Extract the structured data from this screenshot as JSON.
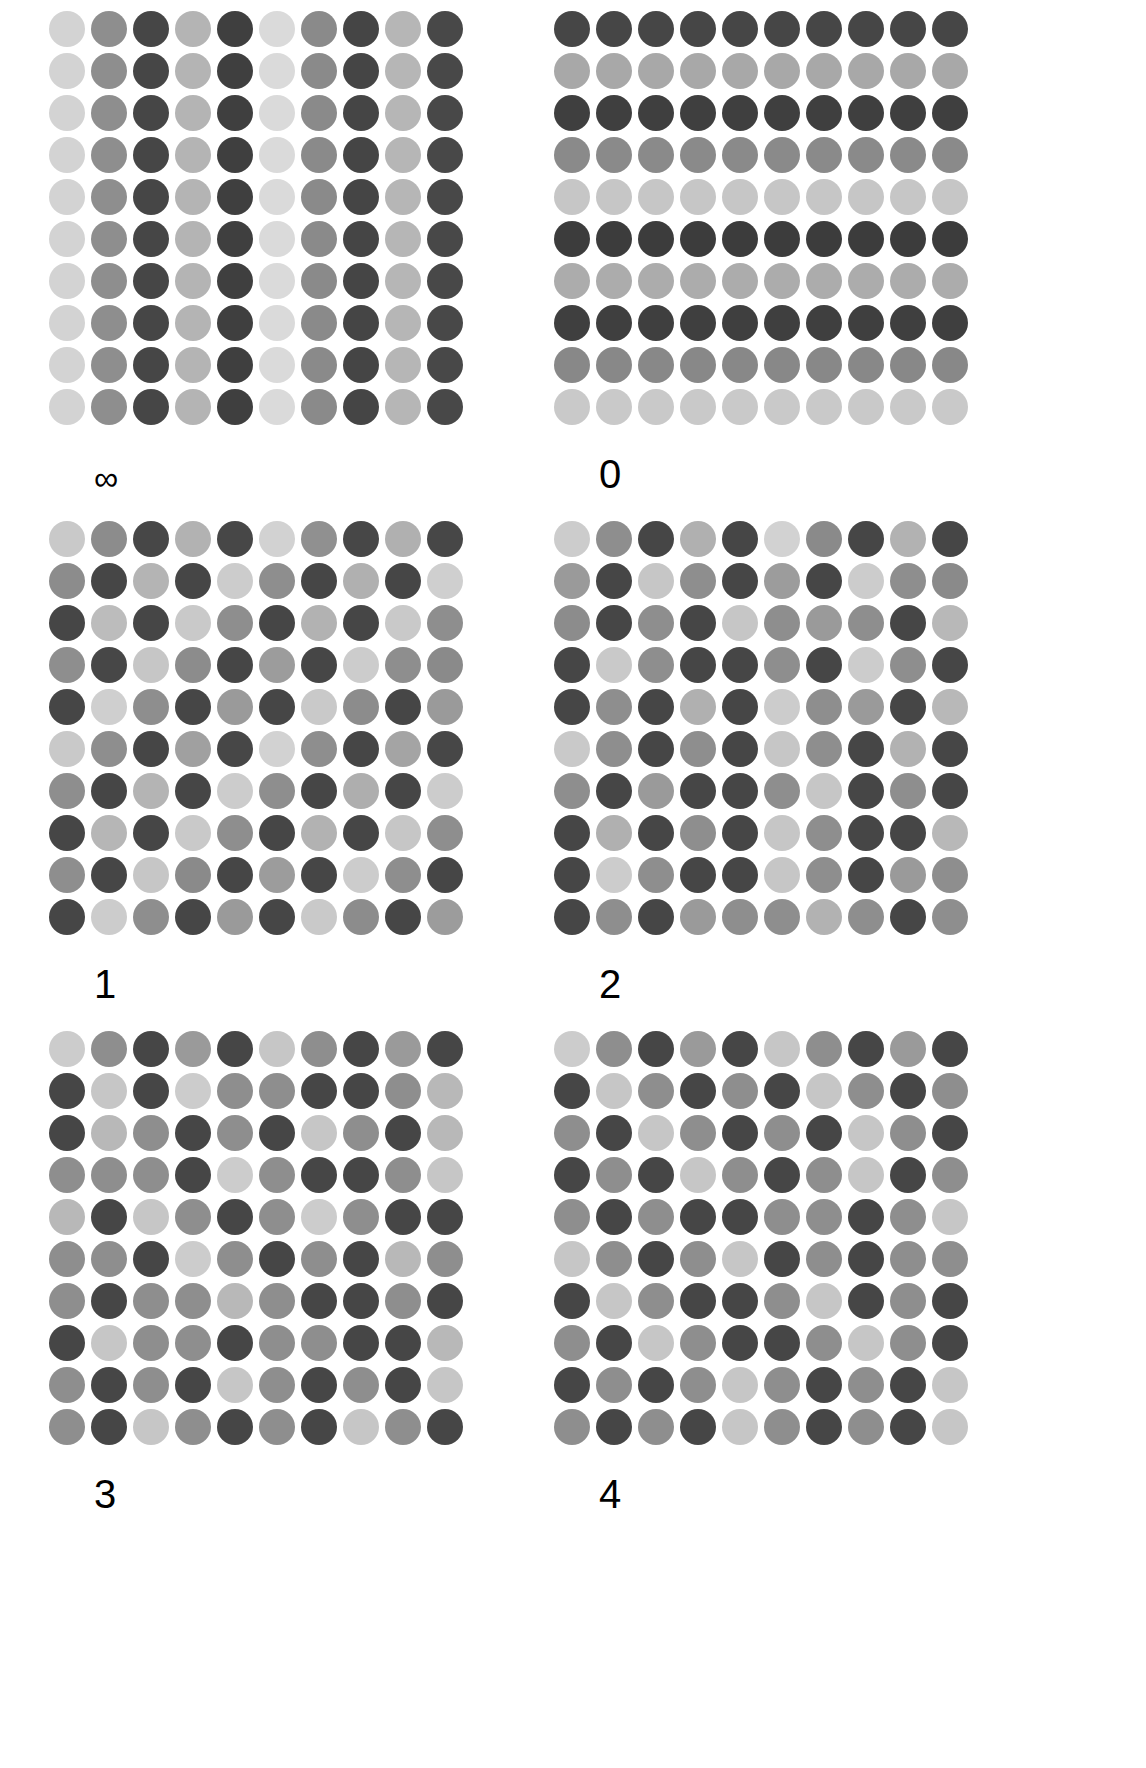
{
  "figure": {
    "background_color": "#ffffff",
    "columns": 2,
    "rows": 3,
    "grid_size": {
      "rows": 10,
      "cols": 10
    },
    "palette": {
      "level_0_lightest": "#d3d3d3",
      "level_1_light": "#c0c0c0",
      "level_2_mid": "#9a9a9a",
      "level_3_dark_mid": "#7a7a7a",
      "level_4_darkest": "#464646"
    }
  },
  "panels": [
    {
      "id": "panel-inf",
      "label": "∞",
      "label_name": "infinity",
      "structure": "vertical-stripes",
      "matrix": [
        [
          "#d3d3d3",
          "#8e8e8e",
          "#464646",
          "#b4b4b4",
          "#3f3f3f",
          "#dadada",
          "#8a8a8a",
          "#454545",
          "#b6b6b6",
          "#484848"
        ],
        [
          "#d3d3d3",
          "#8e8e8e",
          "#464646",
          "#b4b4b4",
          "#3f3f3f",
          "#dadada",
          "#8a8a8a",
          "#454545",
          "#b6b6b6",
          "#484848"
        ],
        [
          "#d3d3d3",
          "#8e8e8e",
          "#464646",
          "#b4b4b4",
          "#3f3f3f",
          "#dadada",
          "#8a8a8a",
          "#454545",
          "#b6b6b6",
          "#484848"
        ],
        [
          "#d3d3d3",
          "#8e8e8e",
          "#464646",
          "#b4b4b4",
          "#3f3f3f",
          "#dadada",
          "#8a8a8a",
          "#454545",
          "#b6b6b6",
          "#484848"
        ],
        [
          "#d3d3d3",
          "#8e8e8e",
          "#464646",
          "#b4b4b4",
          "#3f3f3f",
          "#dadada",
          "#8a8a8a",
          "#454545",
          "#b6b6b6",
          "#484848"
        ],
        [
          "#d3d3d3",
          "#8e8e8e",
          "#464646",
          "#b4b4b4",
          "#3f3f3f",
          "#dadada",
          "#8a8a8a",
          "#454545",
          "#b6b6b6",
          "#484848"
        ],
        [
          "#d3d3d3",
          "#8e8e8e",
          "#464646",
          "#b4b4b4",
          "#3f3f3f",
          "#dadada",
          "#8a8a8a",
          "#454545",
          "#b6b6b6",
          "#484848"
        ],
        [
          "#d3d3d3",
          "#8e8e8e",
          "#464646",
          "#b4b4b4",
          "#3f3f3f",
          "#dadada",
          "#8a8a8a",
          "#454545",
          "#b6b6b6",
          "#484848"
        ],
        [
          "#d3d3d3",
          "#8e8e8e",
          "#464646",
          "#b4b4b4",
          "#3f3f3f",
          "#dadada",
          "#8a8a8a",
          "#454545",
          "#b6b6b6",
          "#484848"
        ],
        [
          "#d3d3d3",
          "#8e8e8e",
          "#464646",
          "#b4b4b4",
          "#3f3f3f",
          "#dadada",
          "#8a8a8a",
          "#454545",
          "#b6b6b6",
          "#484848"
        ]
      ]
    },
    {
      "id": "panel-0",
      "label": "0",
      "label_name": "zero",
      "structure": "horizontal-stripes",
      "matrix": [
        [
          "#464646",
          "#464646",
          "#464646",
          "#464646",
          "#464646",
          "#464646",
          "#464646",
          "#464646",
          "#464646",
          "#464646"
        ],
        [
          "#a8a8a8",
          "#a8a8a8",
          "#a8a8a8",
          "#a8a8a8",
          "#a8a8a8",
          "#a8a8a8",
          "#a8a8a8",
          "#a8a8a8",
          "#a8a8a8",
          "#a8a8a8"
        ],
        [
          "#3f3f3f",
          "#3f3f3f",
          "#3f3f3f",
          "#3f3f3f",
          "#3f3f3f",
          "#3f3f3f",
          "#3f3f3f",
          "#3f3f3f",
          "#3f3f3f",
          "#3f3f3f"
        ],
        [
          "#8a8a8a",
          "#8a8a8a",
          "#8a8a8a",
          "#8a8a8a",
          "#8a8a8a",
          "#8a8a8a",
          "#8a8a8a",
          "#8a8a8a",
          "#8a8a8a",
          "#8a8a8a"
        ],
        [
          "#c6c6c6",
          "#c6c6c6",
          "#c6c6c6",
          "#c6c6c6",
          "#c6c6c6",
          "#c6c6c6",
          "#c6c6c6",
          "#c6c6c6",
          "#c6c6c6",
          "#c6c6c6"
        ],
        [
          "#3c3c3c",
          "#3c3c3c",
          "#3c3c3c",
          "#3c3c3c",
          "#3c3c3c",
          "#3c3c3c",
          "#3c3c3c",
          "#3c3c3c",
          "#3c3c3c",
          "#3c3c3c"
        ],
        [
          "#acacac",
          "#acacac",
          "#acacac",
          "#acacac",
          "#acacac",
          "#acacac",
          "#acacac",
          "#acacac",
          "#acacac",
          "#acacac"
        ],
        [
          "#3f3f3f",
          "#3f3f3f",
          "#3f3f3f",
          "#3f3f3f",
          "#3f3f3f",
          "#3f3f3f",
          "#3f3f3f",
          "#3f3f3f",
          "#3f3f3f",
          "#3f3f3f"
        ],
        [
          "#888888",
          "#888888",
          "#888888",
          "#888888",
          "#888888",
          "#888888",
          "#888888",
          "#888888",
          "#888888",
          "#888888"
        ],
        [
          "#c9c9c9",
          "#c9c9c9",
          "#c9c9c9",
          "#c9c9c9",
          "#c9c9c9",
          "#c9c9c9",
          "#c9c9c9",
          "#c9c9c9",
          "#c9c9c9",
          "#c9c9c9"
        ]
      ]
    },
    {
      "id": "panel-1",
      "label": "1",
      "label_name": "one",
      "structure": "mixed-low-disorder",
      "matrix": [
        [
          "#c9c9c9",
          "#8c8c8c",
          "#474747",
          "#b2b2b2",
          "#474747",
          "#d2d2d2",
          "#909090",
          "#474747",
          "#b0b0b0",
          "#474747"
        ],
        [
          "#8c8c8c",
          "#464646",
          "#b4b4b4",
          "#464646",
          "#cccccc",
          "#8e8e8e",
          "#464646",
          "#b0b0b0",
          "#464646",
          "#cfcfcf"
        ],
        [
          "#464646",
          "#bcbcbc",
          "#464646",
          "#c9c9c9",
          "#8e8e8e",
          "#464646",
          "#b2b2b2",
          "#464646",
          "#c9c9c9",
          "#8e8e8e"
        ],
        [
          "#8e8e8e",
          "#474747",
          "#c6c6c6",
          "#8c8c8c",
          "#464646",
          "#9c9c9c",
          "#464646",
          "#cccccc",
          "#8e8e8e",
          "#8a8a8a"
        ],
        [
          "#464646",
          "#cfcfcf",
          "#8e8e8e",
          "#464646",
          "#9a9a9a",
          "#464646",
          "#c9c9c9",
          "#8c8c8c",
          "#464646",
          "#9a9a9a"
        ],
        [
          "#c9c9c9",
          "#8e8e8e",
          "#464646",
          "#a0a0a0",
          "#474747",
          "#d2d2d2",
          "#8e8e8e",
          "#464646",
          "#a4a4a4",
          "#474747"
        ],
        [
          "#8e8e8e",
          "#464646",
          "#b4b4b4",
          "#464646",
          "#cccccc",
          "#8e8e8e",
          "#464646",
          "#aeaeae",
          "#464646",
          "#cccccc"
        ],
        [
          "#464646",
          "#b6b6b6",
          "#464646",
          "#c9c9c9",
          "#8e8e8e",
          "#464646",
          "#b2b2b2",
          "#464646",
          "#c6c6c6",
          "#8e8e8e"
        ],
        [
          "#8e8e8e",
          "#464646",
          "#c6c6c6",
          "#8a8a8a",
          "#464646",
          "#9c9c9c",
          "#464646",
          "#cccccc",
          "#8e8e8e",
          "#464646"
        ],
        [
          "#464646",
          "#cccccc",
          "#8e8e8e",
          "#464646",
          "#9a9a9a",
          "#464646",
          "#c9c9c9",
          "#8c8c8c",
          "#464646",
          "#9c9c9c"
        ]
      ]
    },
    {
      "id": "panel-2",
      "label": "2",
      "label_name": "two",
      "structure": "mixed-medium-disorder",
      "matrix": [
        [
          "#cccccc",
          "#8e8e8e",
          "#464646",
          "#b0b0b0",
          "#464646",
          "#d2d2d2",
          "#8a8a8a",
          "#464646",
          "#b2b2b2",
          "#464646"
        ],
        [
          "#9a9a9a",
          "#464646",
          "#c6c6c6",
          "#8e8e8e",
          "#464646",
          "#9c9c9c",
          "#464646",
          "#cccccc",
          "#8e8e8e",
          "#8a8a8a"
        ],
        [
          "#8c8c8c",
          "#464646",
          "#8e8e8e",
          "#464646",
          "#c6c6c6",
          "#8e8e8e",
          "#9a9a9a",
          "#8e8e8e",
          "#464646",
          "#b8b8b8"
        ],
        [
          "#464646",
          "#c9c9c9",
          "#8e8e8e",
          "#464646",
          "#464646",
          "#8e8e8e",
          "#464646",
          "#cccccc",
          "#8e8e8e",
          "#464646"
        ],
        [
          "#464646",
          "#8e8e8e",
          "#464646",
          "#b0b0b0",
          "#464646",
          "#cccccc",
          "#8e8e8e",
          "#9a9a9a",
          "#464646",
          "#b8b8b8"
        ],
        [
          "#c9c9c9",
          "#8e8e8e",
          "#464646",
          "#8e8e8e",
          "#464646",
          "#c6c6c6",
          "#8e8e8e",
          "#464646",
          "#b2b2b2",
          "#464646"
        ],
        [
          "#8e8e8e",
          "#464646",
          "#9a9a9a",
          "#464646",
          "#464646",
          "#8e8e8e",
          "#c6c6c6",
          "#464646",
          "#8e8e8e",
          "#464646"
        ],
        [
          "#464646",
          "#b0b0b0",
          "#464646",
          "#8e8e8e",
          "#464646",
          "#c6c6c6",
          "#8e8e8e",
          "#464646",
          "#464646",
          "#b8b8b8"
        ],
        [
          "#464646",
          "#cccccc",
          "#8e8e8e",
          "#464646",
          "#464646",
          "#c6c6c6",
          "#8e8e8e",
          "#464646",
          "#9a9a9a",
          "#8e8e8e"
        ],
        [
          "#464646",
          "#8e8e8e",
          "#464646",
          "#9a9a9a",
          "#8e8e8e",
          "#8e8e8e",
          "#b2b2b2",
          "#8e8e8e",
          "#464646",
          "#8e8e8e"
        ]
      ]
    },
    {
      "id": "panel-3",
      "label": "3",
      "label_name": "three",
      "structure": "mixed-high-disorder",
      "matrix": [
        [
          "#cccccc",
          "#8e8e8e",
          "#464646",
          "#9a9a9a",
          "#464646",
          "#c6c6c6",
          "#8e8e8e",
          "#464646",
          "#9a9a9a",
          "#464646"
        ],
        [
          "#464646",
          "#c6c6c6",
          "#464646",
          "#cccccc",
          "#8e8e8e",
          "#8e8e8e",
          "#464646",
          "#464646",
          "#8e8e8e",
          "#b8b8b8"
        ],
        [
          "#464646",
          "#b8b8b8",
          "#8e8e8e",
          "#464646",
          "#8e8e8e",
          "#464646",
          "#c6c6c6",
          "#8e8e8e",
          "#464646",
          "#b8b8b8"
        ],
        [
          "#8e8e8e",
          "#8e8e8e",
          "#8e8e8e",
          "#464646",
          "#cccccc",
          "#8e8e8e",
          "#464646",
          "#464646",
          "#8e8e8e",
          "#c6c6c6"
        ],
        [
          "#b8b8b8",
          "#464646",
          "#c6c6c6",
          "#8e8e8e",
          "#464646",
          "#8e8e8e",
          "#cccccc",
          "#8e8e8e",
          "#464646",
          "#464646"
        ],
        [
          "#8e8e8e",
          "#8e8e8e",
          "#464646",
          "#cccccc",
          "#8e8e8e",
          "#464646",
          "#8e8e8e",
          "#464646",
          "#b8b8b8",
          "#8e8e8e"
        ],
        [
          "#8e8e8e",
          "#464646",
          "#8e8e8e",
          "#8e8e8e",
          "#b8b8b8",
          "#8e8e8e",
          "#464646",
          "#464646",
          "#8e8e8e",
          "#464646"
        ],
        [
          "#464646",
          "#c6c6c6",
          "#8e8e8e",
          "#8e8e8e",
          "#464646",
          "#8e8e8e",
          "#8e8e8e",
          "#464646",
          "#464646",
          "#b8b8b8"
        ],
        [
          "#8e8e8e",
          "#464646",
          "#8e8e8e",
          "#464646",
          "#c6c6c6",
          "#8e8e8e",
          "#464646",
          "#8e8e8e",
          "#464646",
          "#c6c6c6"
        ],
        [
          "#8e8e8e",
          "#464646",
          "#c6c6c6",
          "#8e8e8e",
          "#464646",
          "#8e8e8e",
          "#464646",
          "#c6c6c6",
          "#8e8e8e",
          "#464646"
        ]
      ]
    },
    {
      "id": "panel-4",
      "label": "4",
      "label_name": "four",
      "structure": "fully-random",
      "matrix": [
        [
          "#cccccc",
          "#8e8e8e",
          "#464646",
          "#9a9a9a",
          "#464646",
          "#c6c6c6",
          "#8e8e8e",
          "#464646",
          "#9a9a9a",
          "#464646"
        ],
        [
          "#464646",
          "#c6c6c6",
          "#8e8e8e",
          "#464646",
          "#8e8e8e",
          "#464646",
          "#c6c6c6",
          "#8e8e8e",
          "#464646",
          "#8e8e8e"
        ],
        [
          "#8e8e8e",
          "#464646",
          "#c6c6c6",
          "#8e8e8e",
          "#464646",
          "#8e8e8e",
          "#464646",
          "#c6c6c6",
          "#8e8e8e",
          "#464646"
        ],
        [
          "#464646",
          "#8e8e8e",
          "#464646",
          "#c6c6c6",
          "#8e8e8e",
          "#464646",
          "#8e8e8e",
          "#c6c6c6",
          "#464646",
          "#8e8e8e"
        ],
        [
          "#8e8e8e",
          "#464646",
          "#8e8e8e",
          "#464646",
          "#464646",
          "#8e8e8e",
          "#8e8e8e",
          "#464646",
          "#8e8e8e",
          "#c6c6c6"
        ],
        [
          "#c6c6c6",
          "#8e8e8e",
          "#464646",
          "#8e8e8e",
          "#c6c6c6",
          "#464646",
          "#8e8e8e",
          "#464646",
          "#8e8e8e",
          "#8e8e8e"
        ],
        [
          "#464646",
          "#c6c6c6",
          "#8e8e8e",
          "#464646",
          "#464646",
          "#8e8e8e",
          "#c6c6c6",
          "#464646",
          "#8e8e8e",
          "#464646"
        ],
        [
          "#8e8e8e",
          "#464646",
          "#c6c6c6",
          "#8e8e8e",
          "#464646",
          "#464646",
          "#8e8e8e",
          "#c6c6c6",
          "#8e8e8e",
          "#464646"
        ],
        [
          "#464646",
          "#8e8e8e",
          "#464646",
          "#8e8e8e",
          "#c6c6c6",
          "#8e8e8e",
          "#464646",
          "#8e8e8e",
          "#464646",
          "#c6c6c6"
        ],
        [
          "#8e8e8e",
          "#464646",
          "#8e8e8e",
          "#464646",
          "#c6c6c6",
          "#8e8e8e",
          "#464646",
          "#8e8e8e",
          "#464646",
          "#c6c6c6"
        ]
      ]
    }
  ]
}
